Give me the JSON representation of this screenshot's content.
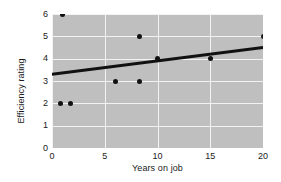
{
  "chart_data": {
    "type": "scatter",
    "title": "",
    "xlabel": "Years on job",
    "ylabel": "Efficiency rating",
    "xlim": [
      0,
      20
    ],
    "ylim": [
      0,
      6
    ],
    "xticks": [
      0,
      5,
      10,
      15,
      20
    ],
    "yticks": [
      0,
      1,
      2,
      3,
      4,
      5,
      6
    ],
    "grid": true,
    "legend": "none",
    "plot_background": "#bfbfbf",
    "gridline_color": "#f2f2f2",
    "point_color": "#111111",
    "line_color": "#111111",
    "points": [
      {
        "x": 1.0,
        "y": 6.0
      },
      {
        "x": 0.8,
        "y": 2.0
      },
      {
        "x": 1.8,
        "y": 2.0
      },
      {
        "x": 6.0,
        "y": 3.0
      },
      {
        "x": 8.3,
        "y": 3.0
      },
      {
        "x": 8.3,
        "y": 5.0
      },
      {
        "x": 10.0,
        "y": 4.0
      },
      {
        "x": 15.0,
        "y": 4.0
      },
      {
        "x": 20.0,
        "y": 5.0
      }
    ],
    "series": [
      {
        "name": "Observations",
        "x": [
          1.0,
          0.8,
          1.8,
          6.0,
          8.3,
          8.3,
          10.0,
          15.0,
          20.0
        ],
        "values": [
          6.0,
          2.0,
          2.0,
          3.0,
          3.0,
          5.0,
          4.0,
          4.0,
          5.0
        ]
      },
      {
        "name": "Regression line",
        "x": [
          0,
          20
        ],
        "values": [
          3.3,
          4.5
        ]
      }
    ],
    "fit_line": {
      "x_start": 0,
      "y_start": 3.3,
      "x_end": 20,
      "y_end": 4.5
    }
  }
}
